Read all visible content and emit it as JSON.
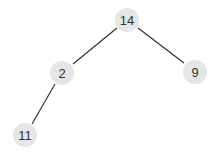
{
  "tree": {
    "nodes": [
      {
        "id": "n14",
        "label": "14",
        "x": 127,
        "y": 20
      },
      {
        "id": "n2",
        "label": "2",
        "x": 62,
        "y": 73
      },
      {
        "id": "n9",
        "label": "9",
        "x": 195,
        "y": 72
      },
      {
        "id": "n11",
        "label": "11",
        "x": 25,
        "y": 135
      }
    ],
    "edges": [
      {
        "from": "n14",
        "to": "n2"
      },
      {
        "from": "n14",
        "to": "n9"
      },
      {
        "from": "n2",
        "to": "n11"
      }
    ],
    "node_fill": "#e6e6e6",
    "edge_color": "#333333"
  }
}
